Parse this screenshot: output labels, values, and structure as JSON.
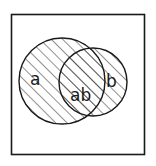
{
  "diagram": {
    "type": "venn",
    "universe_box": {
      "x": 11,
      "y": 14,
      "width": 134,
      "height": 141
    },
    "stroke_color": "#1a1a1a",
    "background_color": "#ffffff",
    "hatch": {
      "direction": "diagonal-up-right",
      "spacing": 8,
      "color": "#333333"
    },
    "sets": [
      {
        "id": "a",
        "label": "a",
        "cx": 62,
        "cy": 81,
        "r": 43,
        "hatched": true,
        "label_x": 30,
        "label_y": 85
      },
      {
        "id": "b",
        "label": "b",
        "cx": 93,
        "cy": 82,
        "r": 34,
        "hatched": true,
        "label_x": 106,
        "label_y": 87
      }
    ],
    "intersection": {
      "label": "ab",
      "label_x": 70,
      "label_y": 101
    }
  }
}
